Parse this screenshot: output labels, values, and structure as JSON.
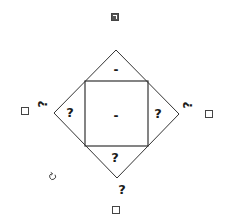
{
  "puzzle": {
    "outer_diamond": {
      "top": [
        116,
        50
      ],
      "right": [
        179,
        114
      ],
      "bottom": [
        117,
        178
      ],
      "left": [
        54,
        113
      ],
      "stroke": "#333333"
    },
    "inner_square": {
      "x1": 85,
      "y1": 81,
      "x2": 148,
      "y2": 146,
      "stroke": "#333333"
    },
    "regions": {
      "top_triangle": "-",
      "center_square": "-",
      "left_triangle": "?",
      "right_triangle": "?",
      "bottom_triangle": "?"
    },
    "outer_labels": {
      "bottom_vertex": "?",
      "left_edge_marker": "?",
      "right_edge_marker": "?"
    },
    "checkboxes": {
      "top": {
        "checked": true
      },
      "left": {
        "checked": false
      },
      "right": {
        "checked": false
      },
      "bottom": {
        "checked": false
      }
    },
    "icons": {
      "rotate": "rotate-icon"
    }
  }
}
